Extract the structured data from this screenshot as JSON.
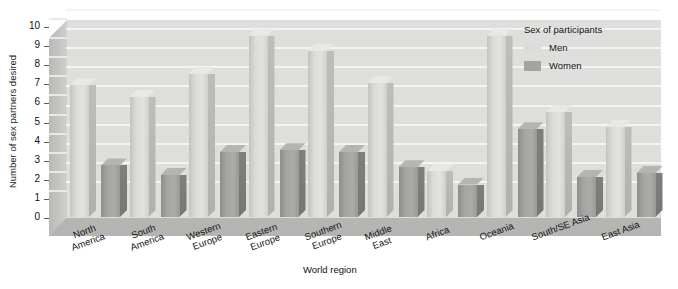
{
  "chart_data": {
    "type": "bar",
    "title": "",
    "xlabel": "World region",
    "ylabel": "Number of sex partners desired",
    "ylim": [
      0,
      10
    ],
    "yticks": [
      "0",
      "1",
      "2",
      "3",
      "4",
      "5",
      "6",
      "7",
      "8",
      "9",
      "10"
    ],
    "grid": true,
    "legend_position": "top-right",
    "legend_title": "Sex of participants",
    "categories": [
      "North\nAmerica",
      "South\nAmerica",
      "Western\nEurope",
      "Eastern\nEurope",
      "Southern\nEurope",
      "Middle\nEast",
      "Africa",
      "Oceania",
      "South/SE Asia",
      "East Asia"
    ],
    "series": [
      {
        "name": "Men",
        "color": "#dcdcda",
        "values": [
          6.9,
          6.3,
          7.5,
          9.5,
          8.7,
          7.0,
          2.4,
          9.5,
          5.5,
          4.7
        ]
      },
      {
        "name": "Women",
        "color": "#a3a3a1",
        "values": [
          2.7,
          2.2,
          3.4,
          3.5,
          3.4,
          2.6,
          1.7,
          4.6,
          2.1,
          2.3
        ]
      }
    ]
  }
}
